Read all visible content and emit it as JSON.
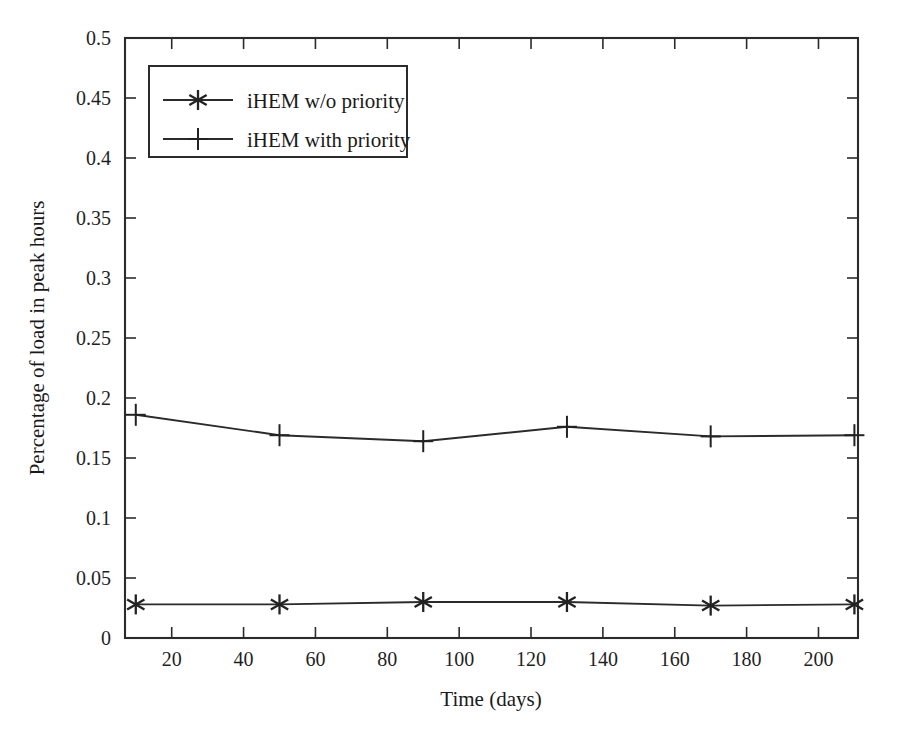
{
  "chart_data": {
    "type": "line",
    "title": "",
    "xlabel": "Time (days)",
    "ylabel": "Percentage of load in peak hours",
    "xlim": [
      7,
      211
    ],
    "ylim": [
      0,
      0.5
    ],
    "grid": false,
    "legend_position": "upper-left-inside",
    "x": [
      10,
      50,
      90,
      130,
      170,
      210
    ],
    "xticks": [
      20,
      40,
      60,
      80,
      100,
      120,
      140,
      160,
      180,
      200
    ],
    "xtick_labels": [
      "20",
      "40",
      "60",
      "80",
      "100",
      "120",
      "140",
      "160",
      "180",
      "200"
    ],
    "yticks": [
      0,
      0.05,
      0.1,
      0.15,
      0.2,
      0.25,
      0.3,
      0.35,
      0.4,
      0.45,
      0.5
    ],
    "ytick_labels": [
      "0",
      "0.05",
      "0.1",
      "0.15",
      "0.2",
      "0.25",
      "0.3",
      "0.35",
      "0.4",
      "0.45",
      "0.5"
    ],
    "series": [
      {
        "name": "iHEM w/o priority",
        "marker": "star",
        "color": "#2b2b2b",
        "values": [
          0.028,
          0.028,
          0.03,
          0.03,
          0.027,
          0.028
        ]
      },
      {
        "name": "iHEM with priority",
        "marker": "plus",
        "color": "#2b2b2b",
        "values": [
          0.186,
          0.169,
          0.164,
          0.176,
          0.168,
          0.169
        ]
      }
    ]
  },
  "legend": {
    "entries": [
      {
        "label": "iHEM w/o priority",
        "marker": "star"
      },
      {
        "label": "iHEM with priority",
        "marker": "plus"
      }
    ]
  },
  "axes": {
    "x_title": "Time (days)",
    "y_title": "Percentage of load in peak hours"
  }
}
